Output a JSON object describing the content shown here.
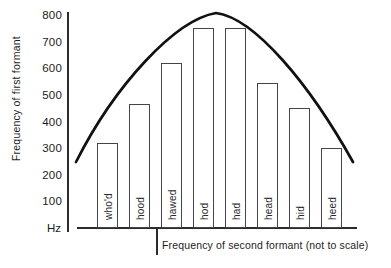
{
  "chart_data": {
    "type": "bar",
    "title": "",
    "categories": [
      "who'd",
      "hood",
      "hawed",
      "hod",
      "had",
      "head",
      "hid",
      "heed"
    ],
    "values": [
      320,
      465,
      620,
      750,
      750,
      545,
      450,
      300
    ],
    "ylabel": "Frequency of first formant",
    "xlabel": "Frequency of second formant (not to scale)",
    "y_unit": "Hz",
    "y_ticks": [
      800,
      700,
      600,
      500,
      400,
      300,
      200,
      100
    ],
    "ylim": [
      0,
      800
    ],
    "x_not_to_scale": true,
    "grid": false,
    "legend": false,
    "annotation": "bell-shaped envelope curve arching over the vowel bars",
    "envelope_path": "M 76 162 C 115 85, 175 20, 216 13 C 255 18, 310 85, 353 162",
    "bar_fill": "#ffffff",
    "bar_border": "#454545",
    "curve_color": "#111111",
    "axis_color": "#2b2b2b",
    "text_color": "#1d1d1d",
    "background": "#ffffff"
  }
}
